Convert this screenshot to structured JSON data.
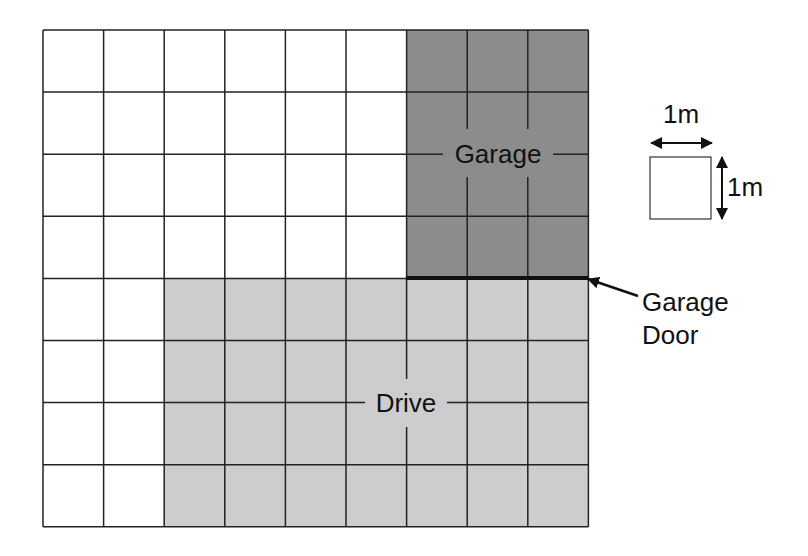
{
  "diagram": {
    "grid": {
      "cols": 9,
      "rows": 8,
      "left": 43,
      "top": 30,
      "cell_w": 60.6,
      "cell_h": 62.1
    },
    "regions": {
      "garage": {
        "label": "Garage",
        "col_start": 6,
        "col_end": 9,
        "row_start": 0,
        "row_end": 4,
        "color": "#8c8c8c"
      },
      "drive": {
        "label": "Drive",
        "col_start": 2,
        "col_end": 9,
        "row_start": 4,
        "row_end": 8,
        "color": "#cdcdcd"
      }
    },
    "garage_door": {
      "label_line1": "Garage",
      "label_line2": "Door"
    },
    "scale": {
      "width_label": "1m",
      "height_label": "1m"
    },
    "colors": {
      "line": "#222222",
      "background": "#ffffff"
    }
  }
}
